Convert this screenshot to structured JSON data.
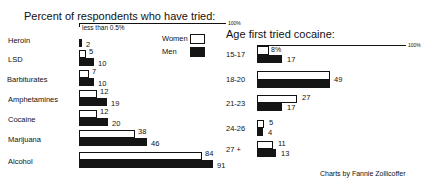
{
  "left_chart": {
    "title": "Percent of respondents who have tried:",
    "scale_label": "100%",
    "note": "less than 0.5%",
    "legend": {
      "women": "Women",
      "men": "Men"
    }
  },
  "right_chart": {
    "title": "Age first tried cocaine:",
    "scale_label": "100%"
  },
  "credit": "Charts by Fannie Zollicoffer",
  "chart_data": [
    {
      "type": "bar",
      "orientation": "horizontal",
      "title": "Percent of respondents who have tried:",
      "categories": [
        "Heroin",
        "LSD",
        "Barbiturates",
        "Amphetamines",
        "Cocaine",
        "Marijuana",
        "Alcohol"
      ],
      "series": [
        {
          "name": "Women",
          "values": [
            0.5,
            5,
            7,
            12,
            12,
            38,
            84
          ],
          "labels": [
            "less than 0.5%",
            "5",
            "7",
            "12",
            "12",
            "38",
            "84"
          ],
          "color": "#ffffff"
        },
        {
          "name": "Men",
          "values": [
            2,
            10,
            10,
            19,
            20,
            46,
            91
          ],
          "labels": [
            "2",
            "10",
            "10",
            "19",
            "20",
            "46",
            "91"
          ],
          "color": "#151515"
        }
      ],
      "xlim": [
        0,
        100
      ],
      "scale_marker": "100%",
      "legend_position": "right"
    },
    {
      "type": "bar",
      "orientation": "horizontal",
      "title": "Age first tried cocaine:",
      "categories": [
        "15-17",
        "18-20",
        "21-23",
        "24-26",
        "27 +"
      ],
      "series": [
        {
          "name": "Women",
          "values": [
            8,
            49,
            27,
            5,
            11
          ],
          "labels": [
            "8%",
            "49",
            "27",
            "5",
            "11"
          ],
          "color": "#ffffff"
        },
        {
          "name": "Men",
          "values": [
            17,
            49,
            17,
            4,
            13
          ],
          "labels": [
            "17",
            "",
            "17",
            "4",
            "13"
          ],
          "color": "#151515"
        }
      ],
      "xlim": [
        0,
        100
      ],
      "scale_marker": "100%"
    }
  ]
}
